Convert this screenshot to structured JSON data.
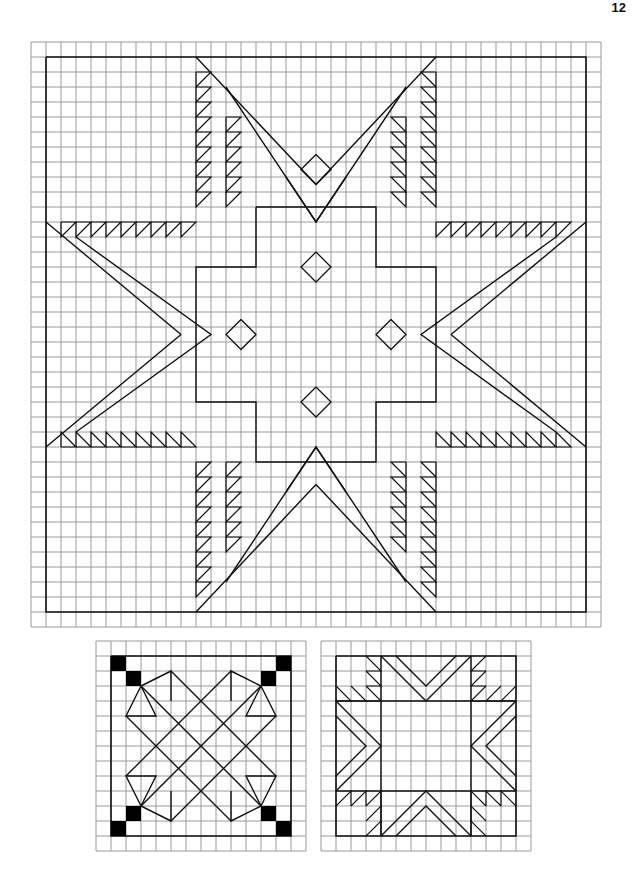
{
  "page": {
    "number": "12"
  },
  "main_pattern": {
    "name": "eight-point-star-quilt",
    "grid_cols": 38,
    "grid_rows": 39,
    "cell_px": 15
  },
  "block_left": {
    "name": "star-x-block",
    "grid_cells": 14
  },
  "block_right": {
    "name": "square-sawtooth-block",
    "grid_cells": 14
  },
  "colors": {
    "grid": "#9a9a9a",
    "line": "#111111",
    "fill": "#000000"
  }
}
